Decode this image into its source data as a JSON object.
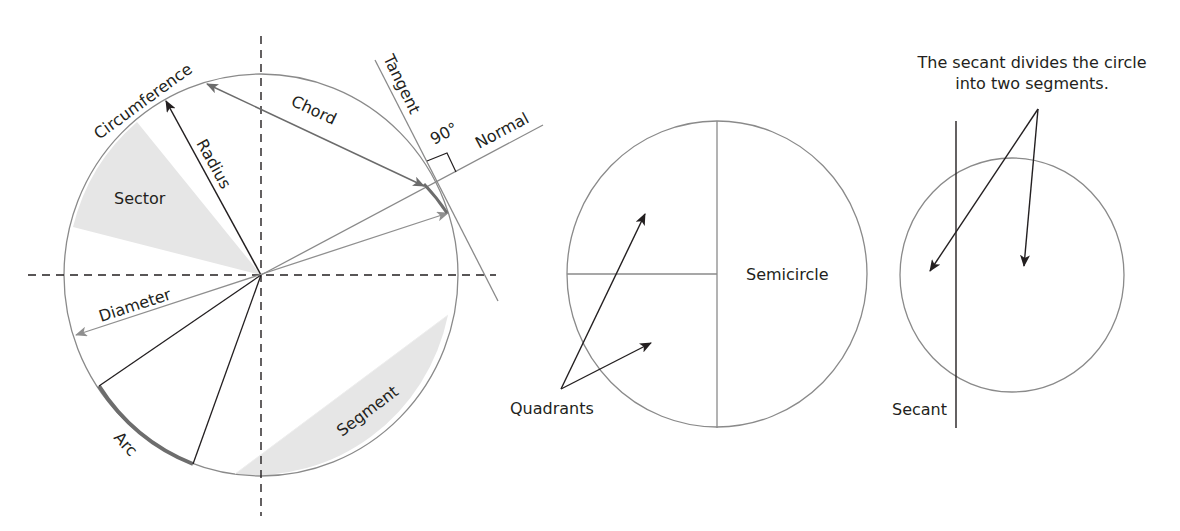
{
  "header": {
    "cut_text": "(partially visible line of text, clipped at top of image)"
  },
  "main_circle": {
    "labels": {
      "circumference": "Circumference",
      "chord": "Chord",
      "tangent": "Tangent",
      "angle": "90°",
      "normal": "Normal",
      "radius": "Radius",
      "sector": "Sector",
      "diameter": "Diameter",
      "arc": "Arc",
      "segment": "Segment"
    }
  },
  "quadrant_circle": {
    "labels": {
      "quadrants": "Quadrants",
      "semicircle": "Semicircle"
    }
  },
  "secant_circle": {
    "caption_line1": "The secant divides the circle",
    "caption_line2": "into two segments.",
    "labels": {
      "secant": "Secant"
    }
  },
  "colors": {
    "ink": "#231f20",
    "circle_stroke": "#8a8a8a",
    "shade": "#e6e6e6",
    "arc_highlight": "#6d6d6d",
    "grey_arrow": "#8f8f8f"
  }
}
